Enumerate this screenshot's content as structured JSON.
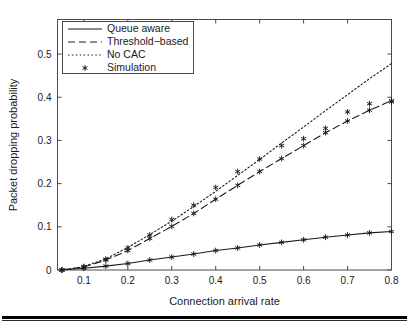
{
  "figure": {
    "name": "packet-dropping-probability-plot"
  },
  "chart_data": {
    "type": "line",
    "title": "",
    "xlabel": "Connection arrival rate",
    "ylabel": "Packet dropping probability",
    "xlim": [
      0.04,
      0.8
    ],
    "ylim": [
      0,
      0.58
    ],
    "xticks": [
      "0.1",
      "0.2",
      "0.3",
      "0.4",
      "0.5",
      "0.6",
      "0.7",
      "0.8"
    ],
    "xtick_values": [
      0.1,
      0.2,
      0.3,
      0.4,
      0.5,
      0.6,
      0.7,
      0.8
    ],
    "yticks": [
      "0",
      "0.1",
      "0.2",
      "0.3",
      "0.4",
      "0.5"
    ],
    "ytick_values": [
      0,
      0.1,
      0.2,
      0.3,
      0.4,
      0.5
    ],
    "grid": false,
    "legend_position": "upper left",
    "x": [
      0.05,
      0.1,
      0.15,
      0.2,
      0.25,
      0.3,
      0.35,
      0.4,
      0.45,
      0.5,
      0.55,
      0.6,
      0.65,
      0.7,
      0.75,
      0.8
    ],
    "series": [
      {
        "name": "Queue aware",
        "style": "solid",
        "values": [
          0.0,
          0.004,
          0.009,
          0.015,
          0.023,
          0.03,
          0.037,
          0.045,
          0.051,
          0.058,
          0.064,
          0.07,
          0.076,
          0.081,
          0.086,
          0.089
        ]
      },
      {
        "name": "Threshold-based",
        "style": "dashed",
        "values": [
          0.0,
          0.007,
          0.023,
          0.045,
          0.073,
          0.101,
          0.131,
          0.164,
          0.196,
          0.228,
          0.258,
          0.288,
          0.318,
          0.345,
          0.37,
          0.392
        ]
      },
      {
        "name": "No CAC",
        "style": "dotted",
        "values": [
          0.0,
          0.008,
          0.026,
          0.052,
          0.082,
          0.113,
          0.147,
          0.182,
          0.219,
          0.256,
          0.294,
          0.331,
          0.369,
          0.406,
          0.443,
          0.478
        ]
      },
      {
        "name": "Simulation",
        "style": "marker",
        "marker": "asterisk",
        "values_queue_aware": [
          0.0,
          0.005,
          0.011,
          0.017,
          0.025,
          0.031,
          0.036,
          0.041,
          0.045,
          0.049,
          0.052,
          0.054,
          0.057,
          0.06,
          0.062,
          0.063
        ],
        "values_threshold": [
          0.0,
          0.006,
          0.024,
          0.051,
          0.079,
          0.104,
          0.136,
          0.161,
          0.175,
          0.199,
          0.221,
          0.226,
          0.245,
          0.251,
          0.254,
          0.277
        ],
        "values_no_cac": [
          0.0,
          0.009,
          0.027,
          0.05,
          0.08,
          0.117,
          0.149,
          0.191,
          0.227,
          0.257,
          0.287,
          0.304,
          0.328,
          0.365,
          0.384,
          0.388
        ]
      }
    ],
    "simulation_points_no_cac": {
      "x": [
        0.05,
        0.1,
        0.15,
        0.2,
        0.25,
        0.3,
        0.35,
        0.4,
        0.45,
        0.5,
        0.55,
        0.6,
        0.65,
        0.7,
        0.75,
        0.8
      ],
      "y": [
        0.0,
        0.008,
        0.025,
        0.051,
        0.081,
        0.117,
        0.15,
        0.191,
        0.228,
        0.257,
        0.288,
        0.304,
        0.328,
        0.366,
        0.385,
        0.389
      ]
    },
    "annotations": []
  },
  "legend": {
    "entries": [
      {
        "label": "Queue aware",
        "style": "solid"
      },
      {
        "label": "Threshold−based",
        "style": "dashed"
      },
      {
        "label": "No CAC",
        "style": "dotted"
      },
      {
        "label": "Simulation",
        "style": "asterisk"
      }
    ]
  },
  "colors": {
    "line": "#1a1a1a",
    "axis": "#3a3a3a",
    "background": "#ffffff",
    "rule": "#000000"
  }
}
